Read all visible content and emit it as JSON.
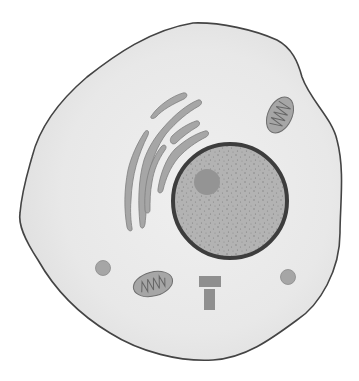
{
  "diagram": {
    "title": "Animal cell",
    "background": "#ffffff",
    "colors": {
      "cytoplasm": "#e6e6e6",
      "cytoplasm_inner": "#ededed",
      "membrane": "#444444",
      "organelle_fill": "#a6a6a6",
      "organelle_stroke": "#7a7a7a",
      "nucleus_envelope": "#3d3d3d",
      "nucleoplasm": "#b3b3b3",
      "nucleolus": "#949494",
      "speckle": "#7f7f7f"
    },
    "parts": [
      {
        "id": "cell-membrane",
        "label": "Cell membrane"
      },
      {
        "id": "cytoplasm",
        "label": "Cytoplasm"
      },
      {
        "id": "nucleus",
        "label": "Nucleus"
      },
      {
        "id": "nucleolus",
        "label": "Nucleolus"
      },
      {
        "id": "golgi-apparatus",
        "label": "Golgi apparatus / ER"
      },
      {
        "id": "mitochondrion",
        "label": "Mitochondrion",
        "count": 2
      },
      {
        "id": "lysosome",
        "label": "Lysosome / vesicle",
        "count": 2
      },
      {
        "id": "centrioles",
        "label": "Centrioles"
      }
    ]
  }
}
